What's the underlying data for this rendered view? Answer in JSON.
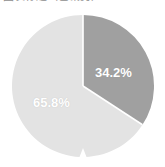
{
  "title": {
    "text": "图表标题（已裁剪）",
    "visible_fragment": true
  },
  "colors": {
    "background": "#ffffff",
    "slice_dark": "#a0a0a0",
    "slice_light": "#e3e3e3",
    "label_text": "#ffffff",
    "separator": "#ffffff"
  },
  "chart_data": {
    "type": "pie",
    "title": "",
    "xlabel": "",
    "ylabel": "",
    "grid": false,
    "legend": "none",
    "start_angle_deg": 90,
    "direction": "clockwise",
    "categories": [
      "Segment A",
      "Segment B"
    ],
    "values": [
      34.2,
      65.8
    ],
    "labels": [
      "34.2%",
      "65.8%"
    ],
    "colors": [
      "#a0a0a0",
      "#e3e3e3"
    ],
    "slices": [
      {
        "name": "Segment A",
        "value": 34.2,
        "label": "34.2%",
        "color": "#a0a0a0",
        "sweep_deg": 123.1
      },
      {
        "name": "Segment B",
        "value": 65.8,
        "label": "65.8%",
        "color": "#e3e3e3",
        "sweep_deg": 236.9
      }
    ]
  }
}
